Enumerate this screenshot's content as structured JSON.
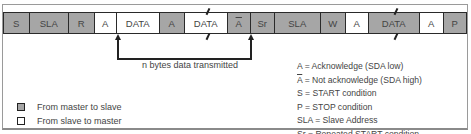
{
  "diagram": {
    "fields": [
      {
        "label": "S",
        "dir": "master",
        "x": 4,
        "w": 26
      },
      {
        "label": "SLA",
        "dir": "master",
        "x": 30,
        "w": 39
      },
      {
        "label": "R",
        "dir": "master",
        "x": 69,
        "w": 26
      },
      {
        "label": "A",
        "dir": "slave",
        "x": 95,
        "w": 22
      },
      {
        "label": "DATA",
        "dir": "slave",
        "x": 117,
        "w": 43
      },
      {
        "label": "A",
        "dir": "master",
        "x": 160,
        "w": 25
      },
      {
        "label": "DATA",
        "dir": "slave",
        "x": 185,
        "w": 43,
        "break": true
      },
      {
        "label": "A",
        "dir": "master",
        "x": 228,
        "w": 23,
        "overline": true
      },
      {
        "label": "Sr",
        "dir": "master",
        "x": 251,
        "w": 24
      },
      {
        "label": "SLA",
        "dir": "master",
        "x": 275,
        "w": 46
      },
      {
        "label": "W",
        "dir": "master",
        "x": 321,
        "w": 25
      },
      {
        "label": "A",
        "dir": "slave",
        "x": 346,
        "w": 23
      },
      {
        "label": "DATA",
        "dir": "master",
        "x": 369,
        "w": 51,
        "break": true
      },
      {
        "label": "A",
        "dir": "slave",
        "x": 420,
        "w": 24
      },
      {
        "label": "P",
        "dir": "master",
        "x": 444,
        "w": 23
      }
    ],
    "bracket_caption": "n bytes data transmitted",
    "legend": [
      {
        "label": "From master to slave",
        "color": "#a6a6a6"
      },
      {
        "label": "From slave to master",
        "color": "#ffffff"
      }
    ],
    "definitions": [
      {
        "symbol": "A",
        "overline": false,
        "text": " = Acknowledge (SDA low)"
      },
      {
        "symbol": "A",
        "overline": true,
        "text": " = Not acknowledge (SDA high)"
      },
      {
        "symbol": "S",
        "overline": false,
        "text": " = START condition"
      },
      {
        "symbol": "P",
        "overline": false,
        "text": " = STOP condition"
      },
      {
        "symbol": "SLA",
        "overline": false,
        "text": " = Slave Address"
      },
      {
        "symbol": "Sr",
        "overline": false,
        "text": " = Repeated START condition"
      }
    ],
    "colors": {
      "master": "#a6a6a6",
      "slave": "#ffffff",
      "border": "#2a2a2a"
    }
  }
}
